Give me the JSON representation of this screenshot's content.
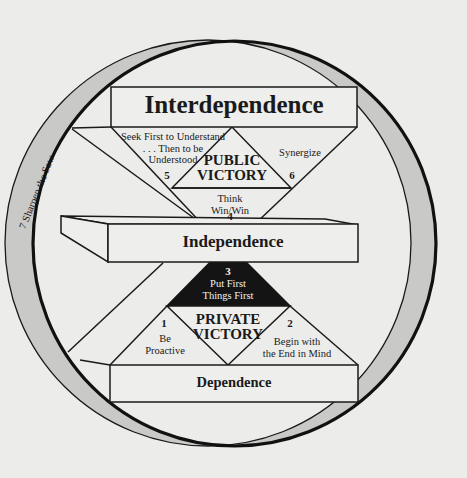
{
  "diagram": {
    "levels": {
      "top": "Interdependence",
      "middle": "Independence",
      "bottom": "Dependence"
    },
    "victories": {
      "public": [
        "PUBLIC",
        "VICTORY"
      ],
      "private": [
        "PRIVATE",
        "VICTORY"
      ]
    },
    "habits": [
      {
        "number": "1",
        "lines": [
          "Be",
          "Proactive"
        ]
      },
      {
        "number": "2",
        "lines": [
          "Begin with",
          "the End in Mind"
        ]
      },
      {
        "number": "3",
        "lines": [
          "Put First",
          "Things First"
        ]
      },
      {
        "number": "4",
        "lines": [
          "Think",
          "Win/Win"
        ]
      },
      {
        "number": "5",
        "lines": [
          "Seek First to Understand",
          ". . . Then to be",
          "Understood"
        ]
      },
      {
        "number": "6",
        "lines": [
          "Synergize"
        ]
      },
      {
        "number": "7",
        "lines": [
          "Sharpen the Saw"
        ]
      }
    ],
    "ring_label": "7  Sharpen the Saw",
    "colors": {
      "background": "#ececea",
      "ring_fill": "#c9c9c7",
      "line": "#1a1a1a",
      "habit3_fill": "#141414",
      "panel_fill": "#eeeeec"
    }
  }
}
